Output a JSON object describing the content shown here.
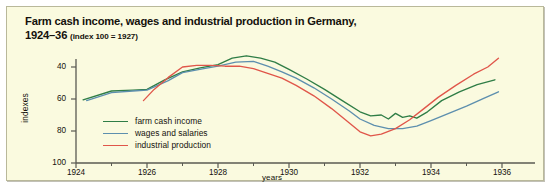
{
  "figure": {
    "background_color": "#fafadf",
    "border_color": "#b9b89a"
  },
  "title": {
    "line1": "Farm cash income, wages and industrial production in Germany,",
    "line2_years": "1924–36",
    "line2_note": "(index 100 = 1927)"
  },
  "axes": {
    "ylabel": "indexes",
    "xlabel": "years",
    "ytick_labels": [
      "100",
      "80",
      "60",
      "40"
    ],
    "xtick_labels": [
      "1924",
      "1926",
      "1928",
      "1930",
      "1932",
      "1934",
      "1936"
    ]
  },
  "legend": [
    {
      "label": "farm cash income",
      "color": "#2f7d46"
    },
    {
      "label": "wages and salaries",
      "color": "#5d8fae"
    },
    {
      "label": "industrial production",
      "color": "#e0564a"
    }
  ],
  "chart_data": {
    "type": "line",
    "title": "Farm cash income, wages and industrial production in Germany, 1924–36 (index 100 = 1927)",
    "xlabel": "years",
    "ylabel": "indexes",
    "xlim": [
      1924,
      1936
    ],
    "ylim": [
      40,
      108
    ],
    "grid": false,
    "legend_position": "inside-lower-left",
    "xticks": [
      1924,
      1926,
      1928,
      1930,
      1932,
      1934,
      1936
    ],
    "xminor_ticks": [
      1925,
      1927,
      1929,
      1931,
      1933,
      1935
    ],
    "yticks": [
      40,
      60,
      80,
      100
    ],
    "series": [
      {
        "name": "farm cash income",
        "color": "#2f7d46",
        "x": [
          1924.2,
          1925.0,
          1925.6,
          1926.0,
          1926.5,
          1927.0,
          1927.5,
          1928.0,
          1928.4,
          1928.8,
          1929.2,
          1929.6,
          1930.0,
          1930.5,
          1931.0,
          1931.5,
          1932.0,
          1932.3,
          1932.6,
          1932.8,
          1933.0,
          1933.2,
          1933.4,
          1933.6,
          1933.9,
          1934.3,
          1934.8,
          1935.3,
          1935.8
        ],
        "y": [
          79.5,
          85.0,
          85.5,
          86.0,
          92.0,
          97.0,
          99.5,
          101.5,
          105.5,
          107.0,
          105.5,
          103.0,
          98.5,
          92.5,
          86.0,
          79.0,
          72.0,
          69.5,
          70.0,
          67.5,
          71.0,
          68.5,
          69.5,
          68.0,
          72.0,
          79.0,
          84.5,
          89.0,
          92.0
        ]
      },
      {
        "name": "wages and salaries",
        "color": "#5d8fae",
        "x": [
          1924.3,
          1925.0,
          1925.6,
          1926.0,
          1926.6,
          1927.0,
          1927.6,
          1928.0,
          1928.5,
          1929.0,
          1929.4,
          1929.8,
          1930.2,
          1930.7,
          1931.2,
          1931.7,
          1932.0,
          1932.4,
          1932.8,
          1933.2,
          1933.6,
          1934.0,
          1934.5,
          1935.0,
          1935.5,
          1935.9
        ],
        "y": [
          79.0,
          84.0,
          85.0,
          85.5,
          91.5,
          96.5,
          99.0,
          100.5,
          103.0,
          103.5,
          100.5,
          97.0,
          93.0,
          87.0,
          80.0,
          72.5,
          67.5,
          63.5,
          61.5,
          61.5,
          63.0,
          66.5,
          71.0,
          75.5,
          80.5,
          84.5
        ]
      },
      {
        "name": "industrial production",
        "color": "#e0564a",
        "x": [
          1925.9,
          1926.2,
          1926.6,
          1927.0,
          1927.4,
          1927.8,
          1928.2,
          1928.6,
          1929.0,
          1929.4,
          1929.8,
          1930.2,
          1930.7,
          1931.2,
          1931.7,
          1932.0,
          1932.3,
          1932.6,
          1933.0,
          1933.4,
          1933.8,
          1934.2,
          1934.7,
          1935.2,
          1935.6,
          1935.9
        ],
        "y": [
          79.0,
          86.0,
          93.5,
          100.0,
          101.0,
          101.0,
          100.5,
          100.5,
          99.0,
          96.0,
          93.0,
          88.5,
          82.0,
          74.0,
          65.0,
          59.5,
          57.0,
          58.0,
          61.5,
          67.0,
          74.0,
          81.0,
          88.5,
          95.5,
          100.0,
          105.5
        ]
      }
    ]
  }
}
